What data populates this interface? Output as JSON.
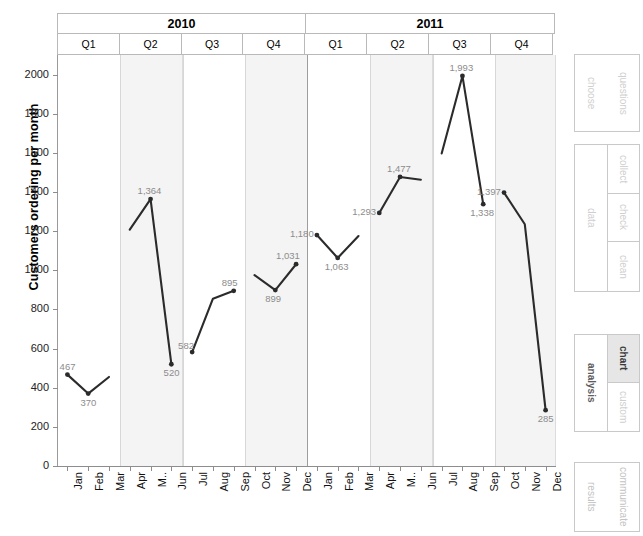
{
  "chart_data": {
    "type": "line",
    "title": "",
    "xlabel": "",
    "ylabel": "Customers ordering per month",
    "ylim": [
      0,
      2100
    ],
    "yticks": [
      2000,
      1800,
      1600,
      1400,
      1200,
      1000,
      800,
      600,
      400,
      200,
      0
    ],
    "grid": false,
    "legend": "none",
    "group_levels": [
      {
        "name": "year",
        "labels": [
          "2010",
          "2011"
        ],
        "spans": [
          12,
          12
        ]
      },
      {
        "name": "quarter",
        "labels": [
          "Q1",
          "Q2",
          "Q3",
          "Q4",
          "Q1",
          "Q2",
          "Q3",
          "Q4"
        ],
        "spans": [
          3,
          3,
          3,
          3,
          3,
          3,
          3,
          3
        ]
      }
    ],
    "shaded_quarters": [
      "2010-Q2",
      "2010-Q4",
      "2011-Q2",
      "2011-Q4"
    ],
    "categories": [
      "Jan",
      "Feb",
      "Mar",
      "Apr",
      "M..",
      "Jun",
      "Jul",
      "Aug",
      "Sep",
      "Oct",
      "Nov",
      "Dec",
      "Jan",
      "Feb",
      "Mar",
      "Apr",
      "M..",
      "Jun",
      "Jul",
      "Aug",
      "Sep",
      "Oct",
      "Nov",
      "Dec"
    ],
    "series": [
      {
        "name": "Customers ordering per month",
        "color": "#2b2b2b",
        "segments": [
          {
            "quarter": "2010-Q1",
            "values": [
              467,
              370,
              455
            ],
            "labels": [
              "467",
              "370",
              ""
            ]
          },
          {
            "quarter": "2010-Q2",
            "values": [
              1208,
              1364,
              520
            ],
            "labels": [
              "",
              "1,364",
              "520"
            ]
          },
          {
            "quarter": "2010-Q3",
            "values": [
              582,
              855,
              895
            ],
            "labels": [
              "582",
              "",
              "895"
            ]
          },
          {
            "quarter": "2010-Q4",
            "values": [
              975,
              899,
              1031
            ],
            "labels": [
              "",
              "899",
              "1,031"
            ]
          },
          {
            "quarter": "2011-Q1",
            "values": [
              1180,
              1063,
              1175
            ],
            "labels": [
              "1,180",
              "1,063",
              ""
            ]
          },
          {
            "quarter": "2011-Q2",
            "values": [
              1293,
              1477,
              1463
            ],
            "labels": [
              "1,293",
              "1,477",
              ""
            ]
          },
          {
            "quarter": "2011-Q3",
            "values": [
              1597,
              1993,
              1338
            ],
            "labels": [
              "",
              "1,993",
              "1,338"
            ]
          },
          {
            "quarter": "2011-Q4",
            "values": [
              1397,
              1235,
              285
            ],
            "labels": [
              "1,397",
              "",
              "285"
            ]
          }
        ]
      }
    ],
    "data_labels": [
      {
        "month": "Jan 2010",
        "text": "467",
        "value": 467
      },
      {
        "month": "Feb 2010",
        "text": "370",
        "value": 370
      },
      {
        "month": "May 2010",
        "text": "1,364",
        "value": 1364
      },
      {
        "month": "Jun 2010",
        "text": "520",
        "value": 520
      },
      {
        "month": "Jul 2010",
        "text": "582",
        "value": 582
      },
      {
        "month": "Sep 2010",
        "text": "895",
        "value": 895
      },
      {
        "month": "Nov 2010",
        "text": "899",
        "value": 899
      },
      {
        "month": "Dec 2010",
        "text": "1,031",
        "value": 1031
      },
      {
        "month": "Jan 2011",
        "text": "1,180",
        "value": 1180
      },
      {
        "month": "Feb 2011",
        "text": "1,063",
        "value": 1063
      },
      {
        "month": "Apr 2011",
        "text": "1,293",
        "value": 1293
      },
      {
        "month": "May 2011",
        "text": "1,477",
        "value": 1477
      },
      {
        "month": "Aug 2011",
        "text": "1,993",
        "value": 1993
      },
      {
        "month": "Sep 2011",
        "text": "1,338",
        "value": 1338
      },
      {
        "month": "Oct 2011",
        "text": "1,397",
        "value": 1397
      },
      {
        "month": "Dec 2011",
        "text": "285",
        "value": 285
      }
    ]
  },
  "axis": {
    "y_title": "Customers ordering per month",
    "y_tick_labels": [
      "2000",
      "1800",
      "1600",
      "1400",
      "1200",
      "1000",
      "800",
      "600",
      "400",
      "200",
      "0"
    ],
    "x_tick_labels": [
      "Jan",
      "Feb",
      "Mar",
      "Apr",
      "M..",
      "Jun",
      "Jul",
      "Aug",
      "Sep",
      "Oct",
      "Nov",
      "Dec",
      "Jan",
      "Feb",
      "Mar",
      "Apr",
      "M..",
      "Jun",
      "Jul",
      "Aug",
      "Sep",
      "Oct",
      "Nov",
      "Dec"
    ]
  },
  "header": {
    "years": [
      "2010",
      "2011"
    ],
    "quarters": [
      "Q1",
      "Q2",
      "Q3",
      "Q4",
      "Q1",
      "Q2",
      "Q3",
      "Q4"
    ]
  },
  "sidebar": {
    "panels": [
      {
        "id": "choose-questions",
        "left_label": "choose",
        "right_label": "questions",
        "active": false
      },
      {
        "id": "data",
        "left_label": "data",
        "items": [
          "collect",
          "check",
          "clean"
        ],
        "active": false
      },
      {
        "id": "analysis",
        "left_label": "analysis",
        "items": [
          "chart",
          "custom"
        ],
        "active_item": "chart"
      },
      {
        "id": "communicate",
        "left_label": "communicate",
        "right_label": "results",
        "active": false
      }
    ]
  },
  "colors": {
    "line": "#2b2b2b",
    "band": "#f4f4f4",
    "axis": "#8d8d8d",
    "label_text": "#8c8c8c",
    "highlight": "#e6e6e6"
  }
}
